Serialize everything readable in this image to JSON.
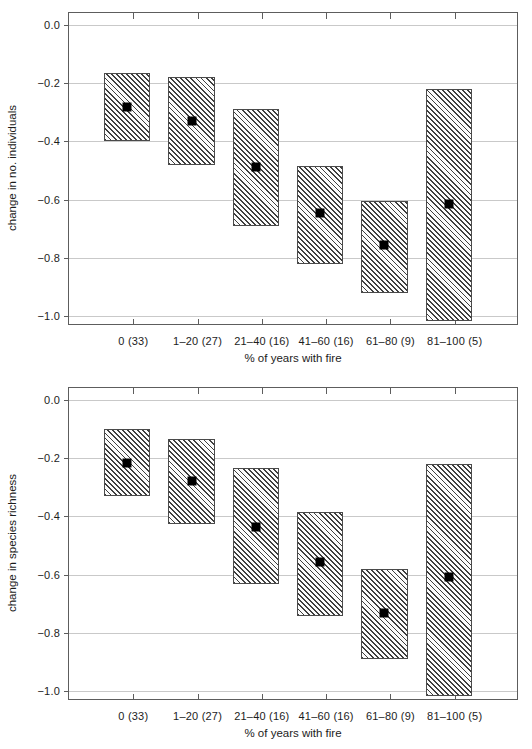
{
  "figure": {
    "background_color": "#ffffff",
    "grid_color": "#c9c9c9",
    "axis_color": "#5d5d5d",
    "marker_color": "#000000",
    "bar_hatch_color": "#3e3e3e",
    "bar_fill_color": "#f2f2f2"
  },
  "chart_data": [
    {
      "type": "bar",
      "panel": "top",
      "title": "",
      "xlabel": "% of years with fire",
      "ylabel": "change in no. individuals",
      "categories": [
        "0 (33)",
        "1–20 (27)",
        "21–40 (16)",
        "41–60 (16)",
        "61–80 (9)",
        "81–100 (5)"
      ],
      "group_counts": [
        33,
        27,
        16,
        16,
        9,
        5
      ],
      "ylim": [
        -1.033,
        0.04
      ],
      "yticks": [
        0.0,
        -0.2,
        -0.4,
        -0.6,
        -0.8,
        -1.0
      ],
      "ytick_labels": [
        "0.0",
        "−0.2",
        "−0.4",
        "−0.6",
        "−0.8",
        "−1.0"
      ],
      "grid": true,
      "legend": "none",
      "series": [
        {
          "name": "confidence interval (box)",
          "upper": [
            -0.165,
            -0.18,
            -0.29,
            -0.485,
            -0.605,
            -0.22
          ],
          "lower": [
            -0.4,
            -0.48,
            -0.69,
            -0.82,
            -0.92,
            -1.015
          ]
        },
        {
          "name": "mean (black square)",
          "values": [
            -0.283,
            -0.33,
            -0.487,
            -0.645,
            -0.755,
            -0.615
          ]
        }
      ]
    },
    {
      "type": "bar",
      "panel": "bottom",
      "title": "",
      "xlabel": "% of years with fire",
      "ylabel": "change in species richness",
      "categories": [
        "0 (33)",
        "1–20 (27)",
        "21–40 (16)",
        "41–60 (16)",
        "61–80 (9)",
        "81–100 (5)"
      ],
      "group_counts": [
        33,
        27,
        16,
        16,
        9,
        5
      ],
      "ylim": [
        -1.033,
        0.04
      ],
      "yticks": [
        0.0,
        -0.2,
        -0.4,
        -0.6,
        -0.8,
        -1.0
      ],
      "ytick_labels": [
        "0.0",
        "−0.2",
        "−0.4",
        "−0.6",
        "−0.8",
        "−1.0"
      ],
      "grid": true,
      "legend": "none",
      "series": [
        {
          "name": "confidence interval (box)",
          "upper": [
            -0.1,
            -0.135,
            -0.235,
            -0.385,
            -0.58,
            -0.22
          ],
          "lower": [
            -0.33,
            -0.425,
            -0.632,
            -0.74,
            -0.888,
            -1.015
          ]
        },
        {
          "name": "mean (black square)",
          "values": [
            -0.218,
            -0.278,
            -0.435,
            -0.558,
            -0.73,
            -0.608
          ]
        }
      ]
    }
  ]
}
